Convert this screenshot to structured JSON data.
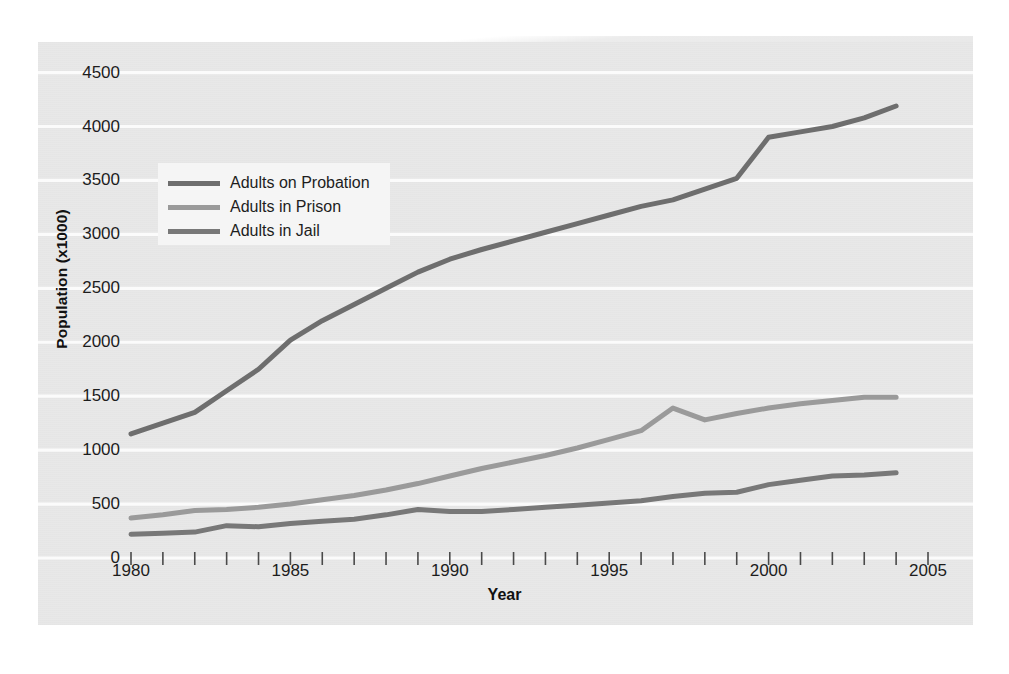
{
  "chart_data": {
    "type": "line",
    "title": "",
    "xlabel": "Year",
    "ylabel": "Population (x1000)",
    "xlim": [
      1980,
      2005
    ],
    "ylim": [
      0,
      4700
    ],
    "grid": true,
    "grid_orientation": "horizontal",
    "legend_position": "upper-left-inside",
    "x_tick_labels": [
      "1980",
      "1985",
      "1990",
      "1995",
      "2000",
      "2005"
    ],
    "x_tick_label_values": [
      1980,
      1985,
      1990,
      1995,
      2000,
      2005
    ],
    "x_minor_ticks_every": 1,
    "y_tick_labels": [
      "0",
      "500",
      "1000",
      "1500",
      "2000",
      "2500",
      "3000",
      "3500",
      "4000",
      "4500"
    ],
    "y_tick_label_values": [
      0,
      500,
      1000,
      1500,
      2000,
      2500,
      3000,
      3500,
      4000,
      4500
    ],
    "x": [
      1980,
      1981,
      1982,
      1983,
      1984,
      1985,
      1986,
      1987,
      1988,
      1989,
      1990,
      1991,
      1992,
      1993,
      1994,
      1995,
      1996,
      1997,
      1998,
      1999,
      2000,
      2001,
      2002,
      2003,
      2004
    ],
    "series": [
      {
        "name": "Adults on Probation",
        "color": "#6e6e6e",
        "values": [
          1150,
          1250,
          1350,
          1550,
          1750,
          2020,
          2200,
          2350,
          2500,
          2650,
          2770,
          2860,
          2940,
          3020,
          3100,
          3180,
          3260,
          3320,
          3420,
          3520,
          3900,
          3950,
          4000,
          4080,
          4190
        ]
      },
      {
        "name": "Adults in Prison",
        "color": "#9a9a9a",
        "values": [
          370,
          400,
          440,
          450,
          470,
          500,
          540,
          580,
          630,
          690,
          760,
          830,
          890,
          950,
          1020,
          1100,
          1180,
          1390,
          1280,
          1340,
          1390,
          1430,
          1460,
          1490,
          1490
        ]
      },
      {
        "name": "Adults in Jail",
        "color": "#787878",
        "values": [
          220,
          230,
          240,
          300,
          290,
          320,
          340,
          360,
          400,
          450,
          430,
          430,
          450,
          470,
          490,
          510,
          530,
          570,
          600,
          610,
          680,
          720,
          760,
          770,
          790
        ]
      }
    ]
  },
  "legend": {
    "items": [
      {
        "label": "Adults on Probation"
      },
      {
        "label": "Adults in Prison"
      },
      {
        "label": "Adults in Jail"
      }
    ]
  }
}
